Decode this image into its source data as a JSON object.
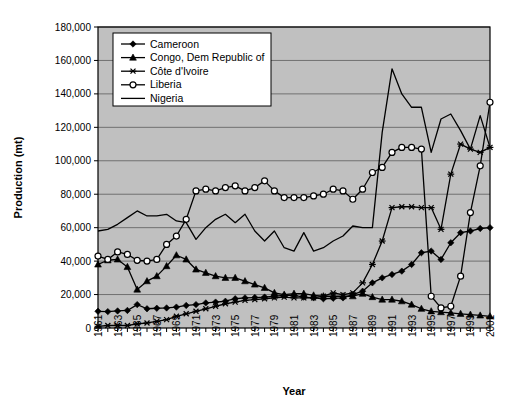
{
  "chart_data": {
    "type": "line",
    "title": "",
    "xlabel": "Year",
    "ylabel": "Production (mt)",
    "xlim": [
      1961,
      2001
    ],
    "ylim": [
      0,
      180000
    ],
    "ytick_step": 20000,
    "grid": true,
    "legend_position": "top-left-inside",
    "plot_background": "#C0C0C0",
    "ytick_labels": [
      "0",
      "20,000",
      "40,000",
      "60,000",
      "80,000",
      "100,000",
      "120,000",
      "140,000",
      "160,000",
      "180,000"
    ],
    "ytick_values": [
      0,
      20000,
      40000,
      60000,
      80000,
      100000,
      120000,
      140000,
      160000,
      180000
    ],
    "x": [
      1961,
      1962,
      1963,
      1964,
      1965,
      1966,
      1967,
      1968,
      1969,
      1970,
      1971,
      1972,
      1973,
      1974,
      1975,
      1976,
      1977,
      1978,
      1979,
      1980,
      1981,
      1982,
      1983,
      1984,
      1985,
      1986,
      1987,
      1988,
      1989,
      1990,
      1991,
      1992,
      1993,
      1994,
      1995,
      1996,
      1997,
      1998,
      1999,
      2000,
      2001
    ],
    "xtick_labels": [
      "1961",
      "1963",
      "1965",
      "1967",
      "1969",
      "1971",
      "1973",
      "1975",
      "1977",
      "1979",
      "1981",
      "1983",
      "1985",
      "1987",
      "1989",
      "1991",
      "1993",
      "1995",
      "1997",
      "1999",
      "2001"
    ],
    "series": [
      {
        "name": "Cameroon",
        "marker": "diamond",
        "color": "#000000",
        "values": [
          10000,
          9800,
          10200,
          10500,
          14000,
          11500,
          11800,
          12000,
          12500,
          13500,
          14000,
          15000,
          15500,
          16000,
          17500,
          18000,
          18200,
          18500,
          19000,
          19500,
          19500,
          18500,
          18000,
          17500,
          17800,
          18000,
          20000,
          22000,
          27000,
          30000,
          32000,
          34000,
          38000,
          45000,
          46000,
          41000,
          51000,
          57000,
          58000,
          59500,
          60000
        ]
      },
      {
        "name": "Congo, Dem Republic of",
        "marker": "triangle",
        "color": "#000000",
        "values": [
          38000,
          40500,
          41000,
          36500,
          23000,
          28000,
          31000,
          37000,
          43500,
          41000,
          35000,
          33000,
          31000,
          30000,
          30000,
          28000,
          26000,
          24000,
          21000,
          20000,
          20500,
          20500,
          19500,
          19000,
          19000,
          19000,
          19000,
          20500,
          18500,
          17000,
          17000,
          16000,
          14000,
          11500,
          10000,
          9500,
          9000,
          8500,
          8000,
          7500,
          7000
        ]
      },
      {
        "name": "Côte d'Ivoire",
        "marker": "asterisk",
        "color": "#000000",
        "values": [
          1000,
          1500,
          1500,
          1500,
          2500,
          3000,
          4000,
          5000,
          7000,
          8500,
          10000,
          11500,
          13000,
          14500,
          15500,
          16500,
          17000,
          17500,
          18000,
          18500,
          18000,
          18000,
          18000,
          19000,
          21000,
          20000,
          21000,
          27000,
          38000,
          52000,
          72000,
          72500,
          72500,
          72000,
          72000,
          59000,
          92000,
          110000,
          107000,
          105000,
          108000
        ]
      },
      {
        "name": "Liberia",
        "marker": "circle",
        "color": "#000000",
        "values": [
          43000,
          41000,
          45500,
          44000,
          40500,
          40000,
          41000,
          50000,
          55000,
          65000,
          82000,
          83000,
          82000,
          84000,
          85000,
          82000,
          84000,
          88000,
          82000,
          78000,
          78000,
          78000,
          79000,
          80000,
          83000,
          82000,
          77000,
          83000,
          93000,
          96000,
          105000,
          108000,
          108000,
          107000,
          19000,
          12000,
          13000,
          31000,
          69000,
          97000,
          135000
        ]
      },
      {
        "name": "Nigeria",
        "marker": "none",
        "color": "#000000",
        "values": [
          58000,
          59000,
          62000,
          66000,
          70000,
          67000,
          67000,
          68000,
          64000,
          63000,
          53000,
          60000,
          65000,
          68000,
          63000,
          68000,
          58000,
          52000,
          58000,
          48000,
          46000,
          57000,
          46000,
          48000,
          52000,
          55000,
          61000,
          60000,
          60000,
          117000,
          155000,
          140000,
          132000,
          132000,
          105000,
          125000,
          128000,
          118000,
          107000,
          127000,
          108000
        ]
      }
    ]
  }
}
